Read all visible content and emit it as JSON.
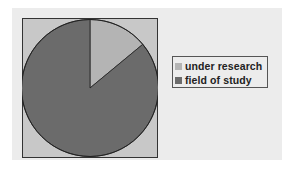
{
  "chart_data": {
    "type": "pie",
    "title": "",
    "categories": [
      "under research",
      "field of study"
    ],
    "values": [
      14,
      86
    ],
    "colors": [
      "#b4b4b4",
      "#6b6b6b"
    ],
    "start_angle_deg": 0,
    "direction": "clockwise",
    "legend": {
      "position": "right",
      "entries": [
        "under research",
        "field of study"
      ]
    },
    "plot_background": "#c8c8c8",
    "chart_background": "#ececec"
  },
  "legend": {
    "items": [
      {
        "label": "under research",
        "color": "#b4b4b4"
      },
      {
        "label": "field of study",
        "color": "#6b6b6b"
      }
    ]
  }
}
